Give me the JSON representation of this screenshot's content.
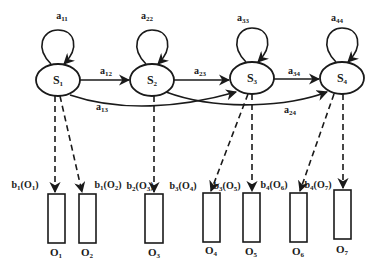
{
  "diagram": {
    "type": "hidden-markov-model",
    "states": [
      {
        "id": "S1",
        "label": "S",
        "sub": "1",
        "cx": 58,
        "cy": 80
      },
      {
        "id": "S2",
        "label": "S",
        "sub": "2",
        "cx": 152,
        "cy": 80
      },
      {
        "id": "S3",
        "label": "S",
        "sub": "3",
        "cx": 252,
        "cy": 78
      },
      {
        "id": "S4",
        "label": "S",
        "sub": "4",
        "cx": 342,
        "cy": 78
      }
    ],
    "self_transitions": [
      {
        "label": "a",
        "sub": "11",
        "x": 62,
        "y": 17
      },
      {
        "label": "a",
        "sub": "22",
        "x": 147,
        "y": 17
      },
      {
        "label": "a",
        "sub": "33",
        "x": 243,
        "y": 19
      },
      {
        "label": "a",
        "sub": "44",
        "x": 337,
        "y": 19
      }
    ],
    "transitions": [
      {
        "from": "S1",
        "to": "S2",
        "label": "a",
        "sub": "12",
        "x": 106,
        "y": 72
      },
      {
        "from": "S2",
        "to": "S3",
        "label": "a",
        "sub": "23",
        "x": 200,
        "y": 72
      },
      {
        "from": "S3",
        "to": "S4",
        "label": "a",
        "sub": "34",
        "x": 294,
        "y": 72
      },
      {
        "from": "S1",
        "to": "S3",
        "label": "a",
        "sub": "13",
        "x": 102,
        "y": 108
      },
      {
        "from": "S2",
        "to": "S4",
        "label": "a",
        "sub": "24",
        "x": 290,
        "y": 111
      }
    ],
    "emissions": [
      {
        "from": "S1",
        "to": "O1",
        "label": "b",
        "sub": "1",
        "obs": "O",
        "obs_sub": "1",
        "x": 25,
        "y": 186
      },
      {
        "from": "S1",
        "to": "O2",
        "label": "b",
        "sub": "1",
        "obs": "O",
        "obs_sub": "2",
        "x": 108,
        "y": 186
      },
      {
        "from": "S2",
        "to": "O3",
        "label": "b",
        "sub": "2",
        "obs": "O",
        "obs_sub": "3",
        "x": 140,
        "y": 187
      },
      {
        "from": "S3",
        "to": "O4",
        "label": "b",
        "sub": "3",
        "obs": "O",
        "obs_sub": "4",
        "x": 183,
        "y": 187
      },
      {
        "from": "S3",
        "to": "O5",
        "label": "b",
        "sub": "3",
        "obs": "O",
        "obs_sub": "5",
        "x": 227,
        "y": 187
      },
      {
        "from": "S4",
        "to": "O6",
        "label": "b",
        "sub": "4",
        "obs": "O",
        "obs_sub": "6",
        "x": 274,
        "y": 186
      },
      {
        "from": "S4",
        "to": "O7",
        "label": "b",
        "sub": "4",
        "obs": "O",
        "obs_sub": "7",
        "x": 318,
        "y": 186
      }
    ],
    "observations": [
      {
        "id": "O1",
        "label": "O",
        "sub": "1",
        "x": 48,
        "y": 194,
        "w": 17,
        "h": 49,
        "lx": 56,
        "ly": 253
      },
      {
        "id": "O2",
        "label": "O",
        "sub": "2",
        "x": 79,
        "y": 194,
        "w": 17,
        "h": 49,
        "lx": 87,
        "ly": 253
      },
      {
        "id": "O3",
        "label": "O",
        "sub": "3",
        "x": 145,
        "y": 194,
        "w": 18,
        "h": 49,
        "lx": 154,
        "ly": 253
      },
      {
        "id": "O4",
        "label": "O",
        "sub": "4",
        "x": 203,
        "y": 193,
        "w": 17,
        "h": 49,
        "lx": 211,
        "ly": 251
      },
      {
        "id": "O5",
        "label": "O",
        "sub": "5",
        "x": 243,
        "y": 193,
        "w": 17,
        "h": 49,
        "lx": 251,
        "ly": 252
      },
      {
        "id": "O6",
        "label": "O",
        "sub": "6",
        "x": 290,
        "y": 193,
        "w": 17,
        "h": 49,
        "lx": 298,
        "ly": 252
      },
      {
        "id": "O7",
        "label": "O",
        "sub": "7",
        "x": 334,
        "y": 190,
        "w": 17,
        "h": 49,
        "lx": 342,
        "ly": 250
      }
    ],
    "colors": {
      "stroke": "#1a1a1a",
      "background": "#ffffff"
    }
  }
}
